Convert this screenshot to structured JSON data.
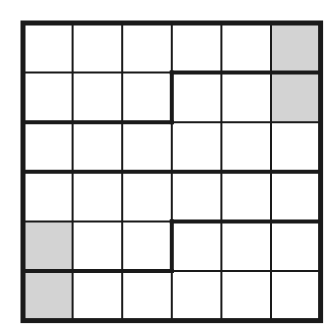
{
  "puzzle": {
    "rows": 6,
    "cols": 6,
    "origin": [
      23,
      23
    ],
    "cell_size": 49.6,
    "colors": {
      "background": "#ffffff",
      "line": "#1a1a1a",
      "shade": "#d3d3d3"
    },
    "line_widths": {
      "thin": 2,
      "thick": 4,
      "border": 5
    },
    "shaded_cells": [
      [
        0,
        5
      ],
      [
        1,
        5
      ],
      [
        4,
        0
      ],
      [
        5,
        0
      ]
    ],
    "thick_h_segments": [
      {
        "row_line": 1,
        "from_col": 3,
        "to_col": 6
      },
      {
        "row_line": 2,
        "from_col": 0,
        "to_col": 3
      },
      {
        "row_line": 3,
        "from_col": 0,
        "to_col": 6
      },
      {
        "row_line": 4,
        "from_col": 3,
        "to_col": 6
      },
      {
        "row_line": 5,
        "from_col": 0,
        "to_col": 3
      }
    ],
    "thick_v_segments": [
      {
        "col_line": 3,
        "from_row": 1,
        "to_row": 2
      },
      {
        "col_line": 3,
        "from_row": 4,
        "to_row": 5
      }
    ]
  }
}
